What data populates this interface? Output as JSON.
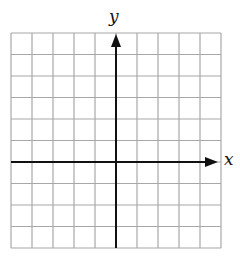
{
  "diagram": {
    "type": "coordinate-plane",
    "grid": {
      "columns": 10,
      "rows": 10,
      "x_range": [
        -5,
        5
      ],
      "y_range": [
        -4,
        6
      ],
      "line_color": "#a8a8a8",
      "axis_color": "#111111"
    },
    "axes": {
      "x_label": "x",
      "y_label": "y"
    }
  }
}
